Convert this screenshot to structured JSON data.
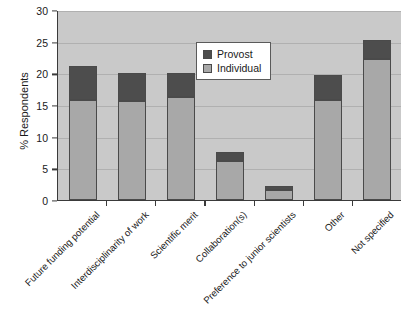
{
  "chart_data": {
    "type": "bar",
    "stacked": true,
    "title": "",
    "xlabel": "",
    "ylabel": "% Respondents",
    "ylim": [
      0,
      30
    ],
    "ytick_step": 5,
    "ytick_labels": [
      "0",
      "5",
      "10",
      "15",
      "20",
      "25",
      "30"
    ],
    "grid": true,
    "legend_position": "inside-top-center",
    "categories": [
      "Future funding potential",
      "Interdisciplinarity of work",
      "Scientific merit",
      "Collaboration(s)",
      "Preference to junior scientists",
      "Other",
      "Not specified"
    ],
    "series": [
      {
        "name": "Individual",
        "color": "#a8a8a8",
        "values": [
          15.8,
          15.7,
          16.2,
          6.2,
          1.6,
          15.8,
          22.2
        ]
      },
      {
        "name": "Provost",
        "color": "#4d4d4d",
        "values": [
          5.3,
          4.3,
          3.8,
          1.4,
          0.6,
          3.9,
          3.0
        ]
      }
    ],
    "totals": [
      21.1,
      20.0,
      20.0,
      7.6,
      2.2,
      19.7,
      25.2
    ]
  },
  "legend": {
    "items": [
      {
        "label": "Provost",
        "color": "#4d4d4d"
      },
      {
        "label": "Individual",
        "color": "#a8a8a8"
      }
    ]
  },
  "colors": {
    "plot_background": "#c9c9c9",
    "gridline": "#b0b0b0",
    "axis": "#3a3a3a",
    "provost": "#4d4d4d",
    "individual": "#a8a8a8"
  }
}
